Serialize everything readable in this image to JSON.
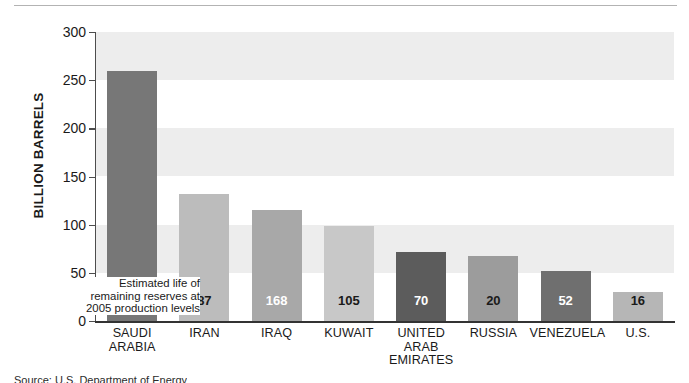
{
  "chart_data": {
    "type": "bar",
    "title": "",
    "subtitle": "",
    "xlabel": "",
    "ylabel": "BILLION BARRELS",
    "ylim": [
      0,
      300
    ],
    "yticks": [
      0,
      50,
      100,
      150,
      200,
      250,
      300
    ],
    "ytick_labels": [
      "0",
      "50",
      "100",
      "150",
      "200",
      "250",
      "300"
    ],
    "grid": false,
    "banded_background": true,
    "band_ranges": [
      [
        50,
        100
      ],
      [
        150,
        200
      ],
      [
        250,
        300
      ]
    ],
    "legend": "none",
    "categories": [
      "SAUDI ARABIA",
      "IRAN",
      "IRAQ",
      "KUWAIT",
      "UNITED ARAB EMIRATES",
      "RUSSIA",
      "VENEZUELA",
      "U.S."
    ],
    "values": [
      260,
      132,
      115,
      99,
      72,
      68,
      52,
      30
    ],
    "series": [
      {
        "name": "Proven oil reserves (billion barrels)",
        "values": [
          260,
          132,
          115,
          99,
          72,
          68,
          52,
          30
        ]
      },
      {
        "name": "Estimated life of remaining reserves (years)",
        "values": [
          75,
          87,
          168,
          105,
          70,
          20,
          52,
          16
        ]
      }
    ],
    "annotations": [
      {
        "text": "Estimated life of remaining reserves at 2005 production levels",
        "lines": [
          "Estimated life of",
          "remaining reserves at",
          "2005 production levels"
        ],
        "points_to": "SAUDI ARABIA"
      },
      {
        "text": "YEARS:",
        "position": "inside-first-bar-top"
      }
    ]
  },
  "axis": {
    "y_title": "BILLION BARRELS",
    "y_ticks": [
      "300",
      "250",
      "200",
      "150",
      "100",
      "50",
      "0"
    ]
  },
  "bars": [
    {
      "category_lines": [
        "SAUDI",
        "ARABIA"
      ],
      "value": 260,
      "years": "75",
      "years_prefix": "YEARS:",
      "color": "#777777",
      "label_color": "#ffffff"
    },
    {
      "category_lines": [
        "IRAN"
      ],
      "value": 132,
      "years": "87",
      "years_prefix": "",
      "color": "#bcbcbc",
      "label_color": "#1a1a1a"
    },
    {
      "category_lines": [
        "IRAQ"
      ],
      "value": 115,
      "years": "168",
      "years_prefix": "",
      "color": "#a8a8a8",
      "label_color": "#ffffff"
    },
    {
      "category_lines": [
        "KUWAIT"
      ],
      "value": 99,
      "years": "105",
      "years_prefix": "",
      "color": "#c8c8c8",
      "label_color": "#1a1a1a"
    },
    {
      "category_lines": [
        "UNITED",
        "ARAB",
        "EMIRATES"
      ],
      "value": 72,
      "years": "70",
      "years_prefix": "",
      "color": "#5c5c5c",
      "label_color": "#ffffff"
    },
    {
      "category_lines": [
        "RUSSIA"
      ],
      "value": 68,
      "years": "20",
      "years_prefix": "",
      "color": "#9c9c9c",
      "label_color": "#1a1a1a"
    },
    {
      "category_lines": [
        "VENEZUELA"
      ],
      "value": 52,
      "years": "52",
      "years_prefix": "",
      "color": "#6f6f6f",
      "label_color": "#ffffff"
    },
    {
      "category_lines": [
        "U.S."
      ],
      "value": 30,
      "years": "16",
      "years_prefix": "",
      "color": "#b6b6b6",
      "label_color": "#1a1a1a"
    }
  ],
  "annotation": {
    "line1": "Estimated life of",
    "line2": "remaining reserves at",
    "line3": "2005 production levels"
  },
  "colors": {
    "band": "#ededed",
    "axis": "#333333",
    "text": "#1a1a1a"
  },
  "source_note": "Source: U.S. Department of Energy"
}
